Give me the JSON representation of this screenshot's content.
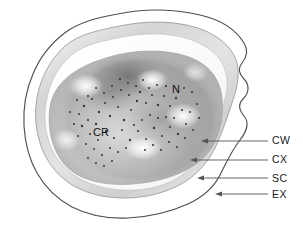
{
  "figure": {
    "type": "labeled-anatomical-diagram",
    "background_color": "#ffffff"
  },
  "internal_labels": [
    {
      "id": "N",
      "text": "N",
      "meaning": "nucleoid"
    },
    {
      "id": "CR",
      "text": "CR",
      "meaning": "core with ribosomes"
    }
  ],
  "callouts": [
    {
      "id": "CW",
      "text": "CW",
      "meaning": "cell wall",
      "arrow_tip": {
        "x": 203,
        "y": 141
      },
      "line_start": {
        "x": 268,
        "y": 141
      }
    },
    {
      "id": "CX",
      "text": "CX",
      "meaning": "cortex",
      "arrow_tip": {
        "x": 192,
        "y": 160
      },
      "line_start": {
        "x": 268,
        "y": 160
      }
    },
    {
      "id": "SC",
      "text": "SC",
      "meaning": "spore coat",
      "arrow_tip": {
        "x": 199,
        "y": 178
      },
      "line_start": {
        "x": 268,
        "y": 178
      }
    },
    {
      "id": "EX",
      "text": "EX",
      "meaning": "exosporium",
      "arrow_tip": {
        "x": 217,
        "y": 194
      },
      "line_start": {
        "x": 268,
        "y": 194
      }
    }
  ],
  "layers": [
    {
      "id": "exosporium",
      "stroke": "#4a4a4a",
      "fill": "#ffffff"
    },
    {
      "id": "spore-coat",
      "stroke": "#8d8d8d",
      "fill": "#e9e9e9"
    },
    {
      "id": "cortex",
      "stroke": "#b5b5b5",
      "fill": "#fbfbfb"
    },
    {
      "id": "cell-wall",
      "stroke": "#9a9a9a",
      "fill": "#d2d2d2"
    },
    {
      "id": "core",
      "stroke": "none",
      "fill": "#a8a8a8"
    }
  ],
  "colors": {
    "ink": "#1a1a1a",
    "arrow": "#555555",
    "granule": "#3a3a3a"
  },
  "granules": {
    "label": "ribosome granules",
    "count": 78
  }
}
